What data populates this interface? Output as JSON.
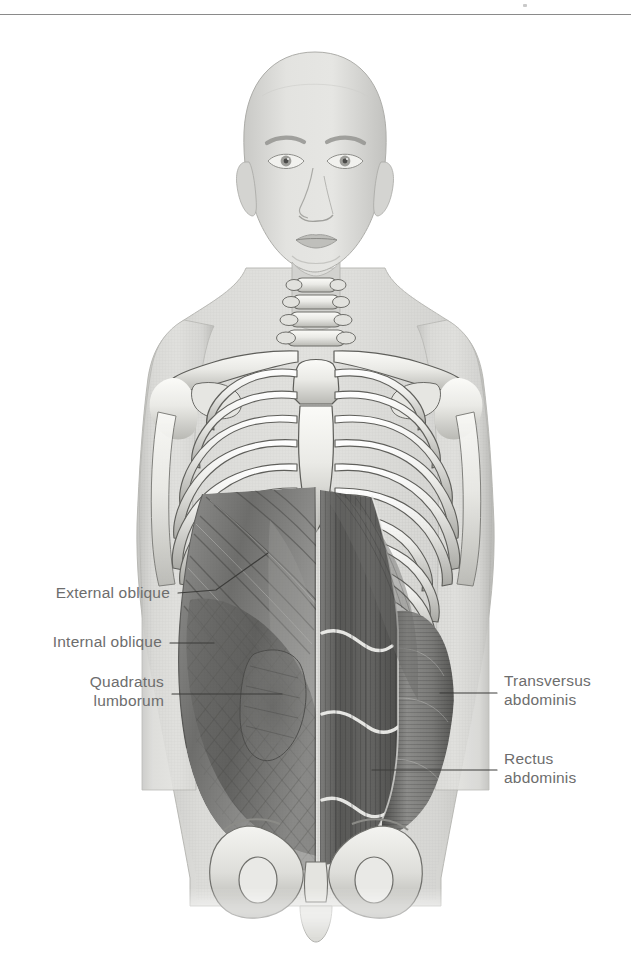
{
  "page": {
    "background_color": "#ffffff",
    "divider_color": "#8a8a8a",
    "label_color": "#6d6d6d",
    "leader_color": "#3c3c3c"
  },
  "labels": {
    "external_oblique": "External oblique",
    "internal_oblique": "Internal oblique",
    "quadratus_lumborum": "Quadratus\nlumborum",
    "transversus_abdominis": "Transversus\nabdominis",
    "rectus_abdominis": "Rectus\nabdominis"
  },
  "figure": {
    "regions": [
      "head",
      "neck",
      "cervical-vertebrae",
      "clavicles",
      "scapulae",
      "humerus-left",
      "humerus-right",
      "sternum",
      "rib-cage",
      "external-oblique",
      "internal-oblique",
      "quadratus-lumborum",
      "transversus-abdominis",
      "rectus-abdominis",
      "pelvis",
      "pubic-symphysis"
    ],
    "palette": {
      "skin": "#d7d7d5",
      "skin_shadow": "#b9b9b7",
      "bone_light": "#f2f2ef",
      "bone_mid": "#cfcfcb",
      "bone_shadow": "#9a9a96",
      "muscle_light": "#9a9a98",
      "muscle_mid": "#7c7c7a",
      "muscle_dark": "#5a5a58",
      "muscle_darkest": "#464644",
      "outline": "#5e5e5c"
    }
  }
}
